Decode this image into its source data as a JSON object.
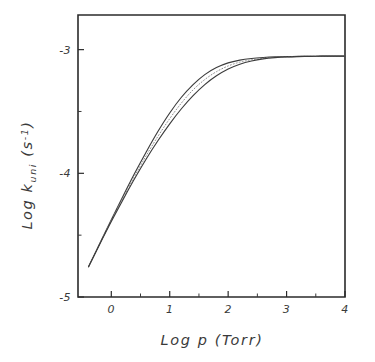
{
  "chart_data": {
    "type": "line",
    "title": "",
    "xlabel": "Log p (Torr)",
    "ylabel": "Log k_uni (s^-1)",
    "ylabel_parts": {
      "prefix": "Log k",
      "subscript": "uni",
      "unit_open": " (s",
      "unit_sup": "-1",
      "unit_close": ")"
    },
    "xlabel_parts": {
      "prefix": "Log p",
      "unit": "(Torr)"
    },
    "xlim": [
      -0.57,
      4.0
    ],
    "ylim": [
      -5.0,
      -2.72
    ],
    "xticks": [
      0,
      1,
      2,
      3,
      4
    ],
    "xticklabels": [
      "0",
      "1",
      "2",
      "3",
      "4"
    ],
    "yticks": [
      -3,
      -4,
      -5
    ],
    "yticklabels": [
      "-3",
      "-4",
      "-5"
    ],
    "x_minor_ticks": [
      0.5,
      1.5,
      2.5,
      3.5
    ],
    "y_minor_ticks": [
      -3.5,
      -4.5
    ],
    "grid": false,
    "legend": false,
    "legend_position": "none",
    "plateau_value": -3.05,
    "series": [
      {
        "name": "upper-bound-curve",
        "style": "solid",
        "color": "#3c3c3c",
        "x": [
          -0.39,
          -0.2,
          0.0,
          0.2,
          0.4,
          0.6,
          0.8,
          1.0,
          1.2,
          1.4,
          1.6,
          1.8,
          2.0,
          2.2,
          2.4,
          2.6,
          2.8,
          3.0,
          3.2,
          3.4,
          3.6,
          3.8,
          4.0
        ],
        "y": [
          -4.755,
          -4.57,
          -4.375,
          -4.185,
          -4.0,
          -3.825,
          -3.66,
          -3.512,
          -3.385,
          -3.283,
          -3.202,
          -3.145,
          -3.107,
          -3.085,
          -3.072,
          -3.064,
          -3.059,
          -3.057,
          -3.055,
          -3.054,
          -3.053,
          -3.052,
          -3.052
        ]
      },
      {
        "name": "middle-curve",
        "style": "dotted",
        "color": "#8e8e8e",
        "x": [
          -0.39,
          -0.2,
          0.0,
          0.2,
          0.4,
          0.6,
          0.8,
          1.0,
          1.2,
          1.4,
          1.6,
          1.8,
          2.0,
          2.2,
          2.4,
          2.6,
          2.8,
          3.0,
          3.2,
          3.4,
          3.6,
          3.8,
          4.0
        ],
        "y": [
          -4.755,
          -4.572,
          -4.382,
          -4.2,
          -4.022,
          -3.855,
          -3.7,
          -3.558,
          -3.432,
          -3.325,
          -3.242,
          -3.178,
          -3.132,
          -3.101,
          -3.082,
          -3.07,
          -3.062,
          -3.058,
          -3.055,
          -3.054,
          -3.053,
          -3.052,
          -3.052
        ]
      },
      {
        "name": "lower-bound-curve",
        "style": "solid",
        "color": "#3c3c3c",
        "x": [
          -0.39,
          -0.2,
          0.0,
          0.2,
          0.4,
          0.6,
          0.8,
          1.0,
          1.2,
          1.4,
          1.6,
          1.8,
          2.0,
          2.2,
          2.4,
          2.6,
          2.8,
          3.0,
          3.2,
          3.4,
          3.6,
          3.8,
          4.0
        ],
        "y": [
          -4.755,
          -4.575,
          -4.39,
          -4.213,
          -4.042,
          -3.882,
          -3.735,
          -3.6,
          -3.478,
          -3.372,
          -3.283,
          -3.212,
          -3.157,
          -3.118,
          -3.092,
          -3.075,
          -3.065,
          -3.059,
          -3.056,
          -3.054,
          -3.053,
          -3.052,
          -3.052
        ]
      }
    ]
  }
}
